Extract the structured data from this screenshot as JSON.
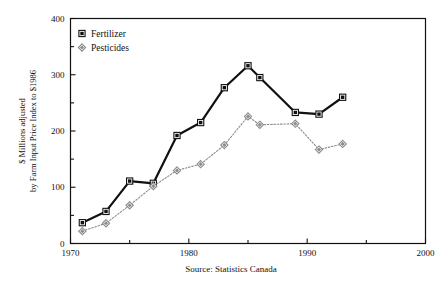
{
  "chart_data": {
    "type": "line",
    "title": "",
    "xlabel": "",
    "ylabel_line1": "$ Millions adjusted",
    "ylabel_line2": "by Farm Input Price Index to $1986",
    "source_note": "Source: Statistics Canada",
    "xlim": [
      1970,
      2000
    ],
    "ylim": [
      0,
      400
    ],
    "xticks": [
      1970,
      1975,
      1980,
      1985,
      1990,
      1995,
      2000
    ],
    "xtick_labels": [
      "1970",
      "",
      "1980",
      "",
      "1990",
      "",
      "2000"
    ],
    "yticks": [
      0,
      50,
      100,
      150,
      200,
      250,
      300,
      350,
      400
    ],
    "ytick_labels": [
      "0",
      "",
      "100",
      "",
      "200",
      "",
      "300",
      "",
      "400"
    ],
    "grid": false,
    "legend_position": "top-left",
    "x": [
      1971,
      1973,
      1975,
      1977,
      1979,
      1981,
      1983,
      1985,
      1986,
      1989,
      1991,
      1993
    ],
    "series": [
      {
        "name": "Fertilizer",
        "marker": "square",
        "color": "#111111",
        "line_style": "solid",
        "line_width": 2.2,
        "values": [
          37,
          57,
          111,
          107,
          192,
          215,
          277,
          316,
          295,
          233,
          230,
          260
        ]
      },
      {
        "name": "Pesticides",
        "marker": "diamond",
        "color": "#8c8c8c",
        "line_style": "dotted",
        "line_width": 1.1,
        "values": [
          22,
          36,
          68,
          102,
          130,
          141,
          175,
          226,
          211,
          213,
          167,
          177
        ]
      }
    ]
  },
  "legend": {
    "items": [
      {
        "label": "Fertilizer",
        "marker": "square",
        "color": "#111111"
      },
      {
        "label": "Pesticides",
        "marker": "diamond",
        "color": "#8c8c8c"
      }
    ]
  },
  "axes": {
    "frame_color": "#111111"
  }
}
